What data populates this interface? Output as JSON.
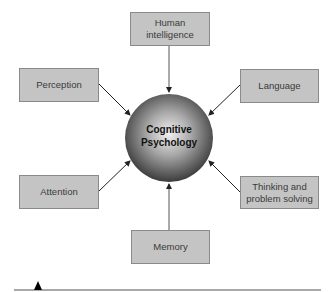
{
  "diagram": {
    "title": "Cognitive Psychology",
    "center": {
      "line1": "Cognitive",
      "line2": "Psychology"
    },
    "nodes": [
      {
        "id": "human-intelligence",
        "line1": "Human",
        "line2": "intelligence"
      },
      {
        "id": "perception",
        "line1": "Perception"
      },
      {
        "id": "language",
        "line1": "Language"
      },
      {
        "id": "attention",
        "line1": "Attention"
      },
      {
        "id": "thinking",
        "line1": "Thinking and",
        "line2": "problem solving"
      },
      {
        "id": "memory",
        "line1": "Memory"
      }
    ],
    "colors": {
      "box_fill": "#c4c4c4",
      "box_border": "#8a8a8a",
      "arrow": "#333333",
      "sphere_light": "#f0f0f0",
      "sphere_dark": "#3a3a3a"
    }
  }
}
